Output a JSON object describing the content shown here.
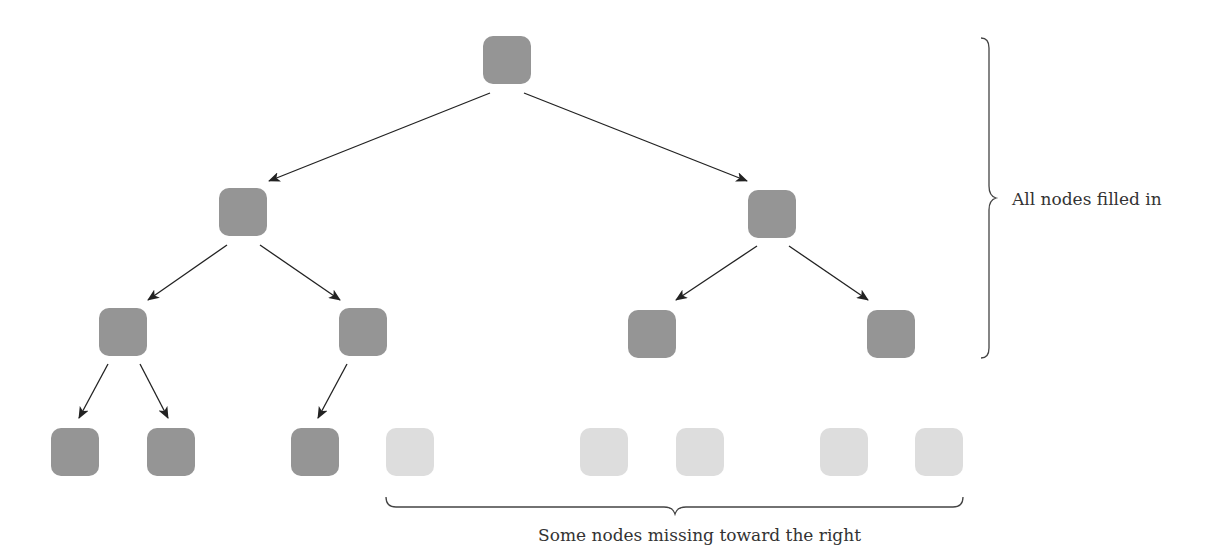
{
  "diagram": {
    "colors": {
      "filled_node": "#959595",
      "missing_node": "#dddddd",
      "edge": "#222222",
      "brace": "#444444",
      "text": "#333333"
    },
    "nodes": [
      {
        "id": "n1",
        "level": 0,
        "x": 483,
        "y": 36,
        "state": "filled"
      },
      {
        "id": "n2",
        "level": 1,
        "x": 219,
        "y": 188,
        "state": "filled"
      },
      {
        "id": "n3",
        "level": 1,
        "x": 748,
        "y": 190,
        "state": "filled"
      },
      {
        "id": "n4",
        "level": 2,
        "x": 99,
        "y": 308,
        "state": "filled"
      },
      {
        "id": "n5",
        "level": 2,
        "x": 339,
        "y": 308,
        "state": "filled"
      },
      {
        "id": "n6",
        "level": 2,
        "x": 628,
        "y": 310,
        "state": "filled"
      },
      {
        "id": "n7",
        "level": 2,
        "x": 867,
        "y": 310,
        "state": "filled"
      },
      {
        "id": "n8",
        "level": 3,
        "x": 51,
        "y": 428,
        "state": "filled"
      },
      {
        "id": "n9",
        "level": 3,
        "x": 147,
        "y": 428,
        "state": "filled"
      },
      {
        "id": "n10",
        "level": 3,
        "x": 291,
        "y": 428,
        "state": "filled"
      },
      {
        "id": "n11",
        "level": 3,
        "x": 386,
        "y": 428,
        "state": "missing"
      },
      {
        "id": "n12",
        "level": 3,
        "x": 580,
        "y": 428,
        "state": "missing"
      },
      {
        "id": "n13",
        "level": 3,
        "x": 676,
        "y": 428,
        "state": "missing"
      },
      {
        "id": "n14",
        "level": 3,
        "x": 820,
        "y": 428,
        "state": "missing"
      },
      {
        "id": "n15",
        "level": 3,
        "x": 915,
        "y": 428,
        "state": "missing"
      }
    ],
    "edges": [
      {
        "from": "n1",
        "to": "n2",
        "x1": 490,
        "y1": 93,
        "x2": 269,
        "y2": 181
      },
      {
        "from": "n1",
        "to": "n3",
        "x1": 524,
        "y1": 93,
        "x2": 747,
        "y2": 181
      },
      {
        "from": "n2",
        "to": "n4",
        "x1": 227,
        "y1": 245,
        "x2": 148,
        "y2": 300
      },
      {
        "from": "n2",
        "to": "n5",
        "x1": 260,
        "y1": 245,
        "x2": 340,
        "y2": 300
      },
      {
        "from": "n3",
        "to": "n6",
        "x1": 757,
        "y1": 246,
        "x2": 676,
        "y2": 300
      },
      {
        "from": "n3",
        "to": "n7",
        "x1": 789,
        "y1": 246,
        "x2": 868,
        "y2": 300
      },
      {
        "from": "n4",
        "to": "n8",
        "x1": 108,
        "y1": 364,
        "x2": 79,
        "y2": 418
      },
      {
        "from": "n4",
        "to": "n9",
        "x1": 140,
        "y1": 364,
        "x2": 168,
        "y2": 418
      },
      {
        "from": "n5",
        "to": "n10",
        "x1": 347,
        "y1": 364,
        "x2": 318,
        "y2": 418
      }
    ],
    "annotations": {
      "right_brace_label": "All nodes filled in",
      "bottom_brace_label": "Some nodes missing toward the right"
    }
  }
}
